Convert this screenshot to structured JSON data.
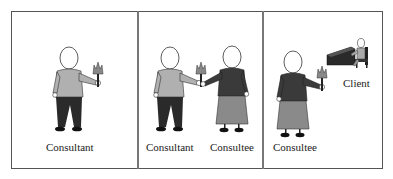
{
  "figure": {
    "panels": [
      {
        "id": "panel-1",
        "figures": [
          "consultant"
        ],
        "labels": [
          "Consultant"
        ]
      },
      {
        "id": "panel-2",
        "figures": [
          "consultant",
          "consultee"
        ],
        "labels": [
          "Consultant",
          "Consultee"
        ]
      },
      {
        "id": "panel-3",
        "figures": [
          "consultee",
          "client"
        ],
        "labels": [
          "Consultee",
          "Client"
        ]
      }
    ],
    "colors": {
      "border": "#555555",
      "consultant_shirt": "#b0b0b0",
      "consultant_pants": "#2a2a2a",
      "consultee_top": "#3a3a3a",
      "consultee_skirt": "#8a8a8a",
      "torch": "#777777"
    }
  }
}
